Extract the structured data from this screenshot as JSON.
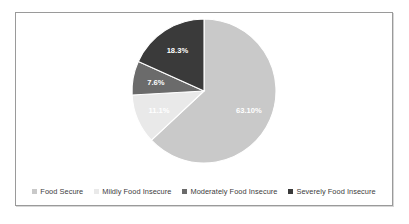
{
  "chart_data": {
    "type": "pie",
    "title": "",
    "subtitle": "",
    "xlabel": "",
    "ylabel": "",
    "legend_position": "bottom",
    "grid": false,
    "start_angle_deg": 0,
    "direction": "clockwise",
    "categories": [
      "Food Secure",
      "Mildly Food Insecure",
      "Moderately Food Insecure",
      "Severely Food Insecure"
    ],
    "values": [
      63.1,
      11.1,
      7.6,
      18.3
    ],
    "labels": [
      "63.10%",
      "11.1%",
      "7.6%",
      "18.3%"
    ],
    "colors": [
      "#c9c9c9",
      "#e9e9e9",
      "#6b6b6b",
      "#3a3a3a"
    ],
    "label_colors": [
      "#ffffff",
      "#ffffff",
      "#ffffff",
      "#ffffff"
    ],
    "slices": [
      {
        "name": "Food Secure",
        "value": 63.1,
        "label": "63.10%",
        "color": "#c9c9c9",
        "label_color": "#ffffff"
      },
      {
        "name": "Mildly Food Insecure",
        "value": 11.1,
        "label": "11.1%",
        "color": "#e9e9e9",
        "label_color": "#ffffff"
      },
      {
        "name": "Moderately Food Insecure",
        "value": 7.6,
        "label": "7.6%",
        "color": "#6b6b6b",
        "label_color": "#ffffff"
      },
      {
        "name": "Severely Food Insecure",
        "value": 18.3,
        "label": "18.3%",
        "color": "#3a3a3a",
        "label_color": "#ffffff"
      }
    ]
  },
  "legend": {
    "items": [
      {
        "label": "Food Secure",
        "color": "#c9c9c9"
      },
      {
        "label": "Mildly Food Insecure",
        "color": "#e9e9e9"
      },
      {
        "label": "Moderately Food Insecure",
        "color": "#6b6b6b"
      },
      {
        "label": "Severely Food Insecure",
        "color": "#3a3a3a"
      }
    ]
  },
  "frame": {
    "border_color": "#9a9a9a",
    "background": "#ffffff"
  }
}
